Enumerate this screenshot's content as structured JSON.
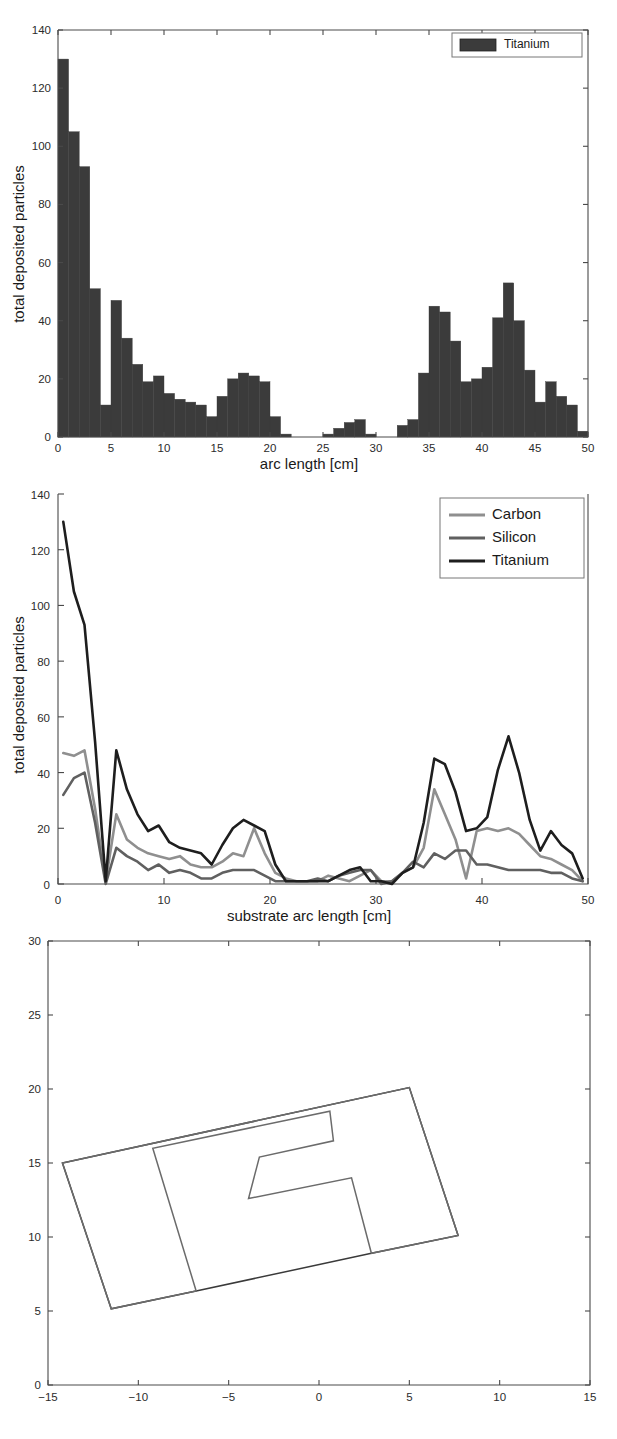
{
  "figure": {
    "title": "",
    "panel_count": 3,
    "background": "#ffffff"
  },
  "colors": {
    "carbon": "#8f8f8f",
    "silicon": "#606060",
    "titanium": "#1e1e1e",
    "bar_fill": "#3b3b3b",
    "axis": "#4a4a4a",
    "substrate_outline": "#3a3a3a",
    "deposit_outline": "#6b6b6b"
  },
  "panel_a": {
    "name": "titanium-histogram",
    "legend": {
      "position": "top-right",
      "entries": [
        {
          "label": "Titanium",
          "swatch": "#3b3b3b",
          "type": "patch"
        }
      ]
    },
    "chart_data": {
      "type": "bar",
      "title": "",
      "xlabel": "arc length [cm]",
      "ylabel": "total deposited particles",
      "xlim": [
        0,
        50
      ],
      "ylim": [
        0,
        140
      ],
      "xticks": [
        0,
        5,
        10,
        15,
        20,
        25,
        30,
        35,
        40,
        45,
        50
      ],
      "yticks": [
        0,
        20,
        40,
        60,
        80,
        100,
        120,
        140
      ],
      "grid": false,
      "bin_width": 1,
      "categories": [
        "0-1",
        "1-2",
        "2-3",
        "3-4",
        "4-5",
        "5-6",
        "6-7",
        "7-8",
        "8-9",
        "9-10",
        "10-11",
        "11-12",
        "12-13",
        "13-14",
        "14-15",
        "15-16",
        "16-17",
        "17-18",
        "18-19",
        "19-20",
        "20-21",
        "21-22",
        "22-23",
        "23-24",
        "24-25",
        "25-26",
        "26-27",
        "27-28",
        "28-29",
        "29-30",
        "30-31",
        "31-32",
        "32-33",
        "33-34",
        "34-35",
        "35-36",
        "36-37",
        "37-38",
        "38-39",
        "39-40",
        "40-41",
        "41-42",
        "42-43",
        "43-44",
        "44-45",
        "45-46",
        "46-47",
        "47-48",
        "48-49",
        "49-50"
      ],
      "x": [
        0.5,
        1.5,
        2.5,
        3.5,
        4.5,
        5.5,
        6.5,
        7.5,
        8.5,
        9.5,
        10.5,
        11.5,
        12.5,
        13.5,
        14.5,
        15.5,
        16.5,
        17.5,
        18.5,
        19.5,
        20.5,
        21.5,
        22.5,
        23.5,
        24.5,
        25.5,
        26.5,
        27.5,
        28.5,
        29.5,
        30.5,
        31.5,
        32.5,
        33.5,
        34.5,
        35.5,
        36.5,
        37.5,
        38.5,
        39.5,
        40.5,
        41.5,
        42.5,
        43.5,
        44.5,
        45.5,
        46.5,
        47.5,
        48.5,
        49.5
      ],
      "values": [
        130,
        105,
        93,
        51,
        11,
        47,
        34,
        25,
        19,
        21,
        15,
        13,
        12,
        11,
        7,
        14,
        20,
        22,
        21,
        19,
        7,
        1,
        0,
        0,
        0,
        1,
        3,
        5,
        6,
        1,
        0,
        0,
        4,
        6,
        22,
        45,
        43,
        33,
        19,
        20,
        24,
        41,
        53,
        40,
        23,
        12,
        19,
        14,
        11,
        2
      ]
    }
  },
  "panel_b": {
    "name": "three-material-line-chart",
    "legend": {
      "position": "top-right",
      "entries": [
        {
          "label": "Carbon",
          "color": "#8f8f8f",
          "type": "line"
        },
        {
          "label": "Silicon",
          "color": "#606060",
          "type": "line"
        },
        {
          "label": "Titanium",
          "color": "#1e1e1e",
          "type": "line"
        }
      ]
    },
    "chart_data": {
      "type": "line",
      "title": "",
      "xlabel": "substrate arc length [cm]",
      "ylabel": "total deposited particles",
      "xlim": [
        0,
        50
      ],
      "ylim": [
        0,
        140
      ],
      "xticks": [
        0,
        10,
        20,
        30,
        40,
        50
      ],
      "yticks": [
        0,
        20,
        40,
        60,
        80,
        100,
        120,
        140
      ],
      "grid": false,
      "x": [
        0.5,
        1.5,
        2.5,
        3.5,
        4.5,
        5.5,
        6.5,
        7.5,
        8.5,
        9.5,
        10.5,
        11.5,
        12.5,
        13.5,
        14.5,
        15.5,
        16.5,
        17.5,
        18.5,
        19.5,
        20.5,
        21.5,
        22.5,
        23.5,
        24.5,
        25.5,
        26.5,
        27.5,
        28.5,
        29.5,
        30.5,
        31.5,
        32.5,
        33.5,
        34.5,
        35.5,
        36.5,
        37.5,
        38.5,
        39.5,
        40.5,
        41.5,
        42.5,
        43.5,
        44.5,
        45.5,
        46.5,
        47.5,
        48.5,
        49.5
      ],
      "series": [
        {
          "name": "Carbon",
          "color": "#8f8f8f",
          "values": [
            47,
            46,
            48,
            27,
            1,
            25,
            16,
            13,
            11,
            10,
            9,
            10,
            7,
            6,
            6,
            8,
            11,
            10,
            20,
            11,
            4,
            2,
            1,
            1,
            1,
            3,
            2,
            1,
            3,
            5,
            1,
            1,
            4,
            6,
            13,
            34,
            25,
            16,
            2,
            19,
            20,
            19,
            20,
            18,
            14,
            10,
            9,
            7,
            5,
            1
          ]
        },
        {
          "name": "Silicon",
          "color": "#606060",
          "values": [
            32,
            38,
            40,
            22,
            0,
            13,
            10,
            8,
            5,
            7,
            4,
            5,
            4,
            2,
            2,
            4,
            5,
            5,
            5,
            3,
            1,
            1,
            1,
            1,
            2,
            1,
            3,
            4,
            5,
            5,
            0,
            1,
            4,
            8,
            6,
            11,
            9,
            12,
            12,
            7,
            7,
            6,
            5,
            5,
            5,
            5,
            4,
            4,
            2,
            1
          ]
        },
        {
          "name": "Titanium",
          "color": "#1e1e1e",
          "values": [
            130,
            105,
            93,
            51,
            1,
            48,
            34,
            25,
            19,
            21,
            15,
            13,
            12,
            11,
            7,
            14,
            20,
            23,
            21,
            19,
            7,
            1,
            1,
            1,
            1,
            1,
            3,
            5,
            6,
            1,
            1,
            0,
            4,
            6,
            22,
            45,
            43,
            33,
            19,
            20,
            24,
            41,
            53,
            40,
            23,
            12,
            19,
            14,
            11,
            2
          ]
        }
      ]
    }
  },
  "panel_c": {
    "name": "substrate-geometry-plot",
    "chart_data": {
      "type": "line",
      "title": "",
      "xlabel": "",
      "ylabel": "",
      "xlim": [
        -15,
        15
      ],
      "ylim": [
        0,
        30
      ],
      "xticks": [
        -15,
        -10,
        -5,
        0,
        5,
        10,
        15
      ],
      "yticks": [
        0,
        5,
        10,
        15,
        20,
        25,
        30
      ],
      "grid": false,
      "shapes": [
        {
          "name": "substrate-outline",
          "color": "#3a3a3a",
          "closed": true,
          "points": [
            [
              -14.2,
              15.0
            ],
            [
              5.0,
              20.1
            ],
            [
              7.7,
              10.1
            ],
            [
              2.9,
              8.9
            ],
            [
              -6.8,
              6.35
            ],
            [
              -11.5,
              5.15
            ]
          ]
        },
        {
          "name": "deposit-region-outline",
          "color": "#6b6b6b",
          "closed": true,
          "points": [
            [
              -14.2,
              15.0
            ],
            [
              -11.5,
              5.15
            ],
            [
              -6.8,
              6.35
            ],
            [
              -9.2,
              16.0
            ],
            [
              0.6,
              18.5
            ],
            [
              0.8,
              16.5
            ],
            [
              -3.3,
              15.4
            ],
            [
              -3.9,
              12.6
            ],
            [
              1.8,
              14.0
            ],
            [
              2.9,
              8.9
            ],
            [
              7.7,
              10.1
            ],
            [
              5.0,
              20.1
            ]
          ]
        }
      ]
    }
  }
}
